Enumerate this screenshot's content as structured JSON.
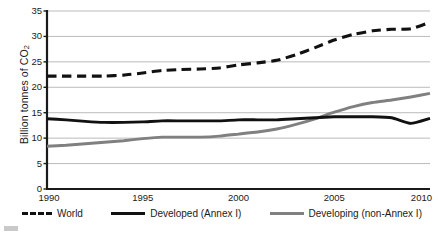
{
  "chart_data": {
    "type": "line",
    "title": "",
    "xlabel": "",
    "ylabel": "Billion tonnes of CO2",
    "ylabel_parts": {
      "main": "Billion tonnes of CO",
      "sub": "2"
    },
    "xlim": [
      1990,
      2010
    ],
    "ylim": [
      0,
      35
    ],
    "ytick_values": [
      0,
      5,
      10,
      15,
      20,
      25,
      30,
      35
    ],
    "ytick_labels": [
      "0",
      "5",
      "10",
      "15",
      "20",
      "25",
      "30",
      "35"
    ],
    "xtick_values": [
      1990,
      1995,
      2000,
      2005,
      2010
    ],
    "xtick_labels": [
      "1990",
      "1995",
      "2000",
      "2005",
      "2010"
    ],
    "grid": "horizontal",
    "grid_color": "#b3b3b3",
    "axis_color": "#1a1a1a",
    "legend_position": "below",
    "x": [
      1990,
      1991,
      1992,
      1993,
      1994,
      1995,
      1996,
      1997,
      1998,
      1999,
      2000,
      2001,
      2002,
      2003,
      2004,
      2005,
      2006,
      2007,
      2008,
      2009,
      2010
    ],
    "series": [
      {
        "name": "World",
        "style": "dashed",
        "color": "#111111",
        "values": [
          22.2,
          22.2,
          22.2,
          22.2,
          22.4,
          22.8,
          23.3,
          23.5,
          23.6,
          23.8,
          24.4,
          24.8,
          25.3,
          26.4,
          27.8,
          29.3,
          30.4,
          31.1,
          31.4,
          31.5,
          32.8
        ]
      },
      {
        "name": "Developed (Annex I)",
        "style": "solid",
        "color": "#111111",
        "values": [
          13.8,
          13.6,
          13.3,
          13.1,
          13.1,
          13.2,
          13.4,
          13.4,
          13.4,
          13.4,
          13.6,
          13.6,
          13.6,
          13.8,
          14.0,
          14.2,
          14.2,
          14.2,
          14.0,
          12.9,
          13.9
        ]
      },
      {
        "name": "Developing (non-Annex I)",
        "style": "solid",
        "color": "#808080",
        "values": [
          8.4,
          8.6,
          8.9,
          9.2,
          9.5,
          9.9,
          10.2,
          10.2,
          10.2,
          10.4,
          10.8,
          11.2,
          11.8,
          12.7,
          13.8,
          15.1,
          16.2,
          17.0,
          17.5,
          18.1,
          18.8
        ]
      }
    ]
  },
  "legend": {
    "items": [
      {
        "label": "World",
        "swatch": "dashed-black-line-icon"
      },
      {
        "label": "Developed (Annex I)",
        "swatch": "solid-black-line-icon"
      },
      {
        "label": "Developing (non-Annex I)",
        "swatch": "solid-gray-line-icon"
      }
    ]
  }
}
